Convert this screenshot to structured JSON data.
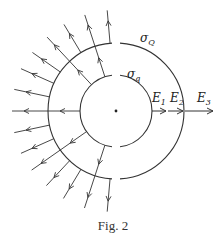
{
  "figure": {
    "caption": "Fig. 2",
    "center": [
      116,
      111
    ],
    "inner_sphere": {
      "radius": 36,
      "label": "σ",
      "label_sub": "q"
    },
    "outer_sphere": {
      "radius": 68,
      "label": "σ",
      "label_sub": "Q"
    },
    "field_labels": [
      {
        "text": "E",
        "sub": "1"
      },
      {
        "text": "E",
        "sub": "2"
      },
      {
        "text": "E",
        "sub": "3"
      }
    ],
    "colors": {
      "line": "#333333",
      "background": "#ffffff"
    },
    "field_lines": [
      {
        "angle": 95,
        "from": "outer",
        "length": 101
      },
      {
        "angle": 108,
        "from": "inner",
        "length": 101
      },
      {
        "angle": 121,
        "from": "outer",
        "length": 101
      },
      {
        "angle": 133,
        "from": "inner",
        "length": 101
      },
      {
        "angle": 145,
        "from": "outer",
        "length": 102
      },
      {
        "angle": 156,
        "from": "outer",
        "length": 104
      },
      {
        "angle": 168,
        "from": "outer",
        "length": 104
      },
      {
        "angle": 180,
        "from": "inner",
        "length": 104
      },
      {
        "angle": 192,
        "from": "outer",
        "length": 104
      },
      {
        "angle": 204,
        "from": "outer",
        "length": 104
      },
      {
        "angle": 215,
        "from": "inner",
        "length": 103
      },
      {
        "angle": 227,
        "from": "outer",
        "length": 102
      },
      {
        "angle": 239,
        "from": "outer",
        "length": 102
      },
      {
        "angle": 252,
        "from": "inner",
        "length": 102
      },
      {
        "angle": 265,
        "from": "outer",
        "length": 101
      }
    ]
  }
}
